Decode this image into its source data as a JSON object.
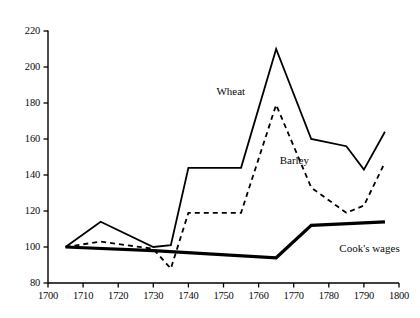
{
  "chart_data": {
    "type": "line",
    "title": "",
    "subtitle": "",
    "xlabel": "",
    "ylabel": "",
    "xlim": [
      1700,
      1800
    ],
    "ylim": [
      80,
      220
    ],
    "grid": false,
    "legend_position": "inline-annotations",
    "xticks": [
      "1700",
      "1710",
      "1720",
      "1730",
      "1740",
      "1750",
      "1760",
      "1770",
      "1780",
      "1790",
      "1800"
    ],
    "xtick_values": [
      1700,
      1710,
      1720,
      1730,
      1740,
      1750,
      1760,
      1770,
      1780,
      1790,
      1800
    ],
    "yticks": [
      "80",
      "100",
      "120",
      "140",
      "160",
      "180",
      "200",
      "220"
    ],
    "ytick_values": [
      80,
      100,
      120,
      140,
      160,
      180,
      200,
      220
    ],
    "series": [
      {
        "name": "Wheat",
        "style": "solid",
        "width": 1.8,
        "color": "#000000",
        "label_x": 1748,
        "label_y": 186,
        "x": [
          1705,
          1715,
          1730,
          1735,
          1740,
          1755,
          1765,
          1775,
          1785,
          1790,
          1796
        ],
        "values": [
          100,
          114,
          100,
          101,
          144,
          144,
          210,
          160,
          156,
          143,
          164
        ]
      },
      {
        "name": "Barley",
        "style": "dashed",
        "width": 1.8,
        "color": "#000000",
        "label_x": 1766,
        "label_y": 148,
        "x": [
          1705,
          1715,
          1730,
          1735,
          1740,
          1755,
          1765,
          1775,
          1785,
          1790,
          1796
        ],
        "values": [
          100,
          103,
          99,
          88,
          119,
          119,
          179,
          133,
          119,
          123,
          147
        ]
      },
      {
        "name": "Cook's wages",
        "style": "thick-solid",
        "width": 3.2,
        "color": "#000000",
        "label_x": 1783,
        "label_y": 99,
        "x": [
          1705,
          1730,
          1765,
          1775,
          1796
        ],
        "values": [
          100,
          98,
          94,
          112,
          114
        ]
      }
    ]
  },
  "axes": {
    "x_axis_name": "year-axis",
    "y_axis_name": "index-axis"
  }
}
